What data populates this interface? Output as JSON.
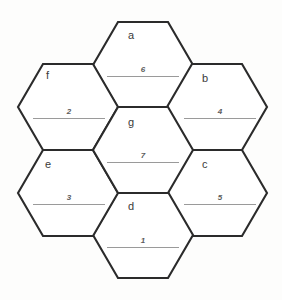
{
  "figure": {
    "type": "hexagon-puzzle-grid",
    "canvas": {
      "width": 282,
      "height": 300
    },
    "colors": {
      "background": "#fdfdfc",
      "hex_fill": "#ffffff",
      "hex_stroke": "#2b2b2b",
      "letter_text": "#3a3a3a",
      "number_text": "#5d5d5d",
      "rule_line": "#9a9a9a"
    },
    "geometry": {
      "hex_half_width": 50,
      "hex_half_height": 43,
      "hex_corner_inset": 25
    }
  },
  "cells": [
    {
      "id": "a",
      "letter": "a",
      "number": "6",
      "cx": 143,
      "cy": 65,
      "letter_x": 128,
      "letter_y": 30,
      "number_x": 143,
      "number_y": 66,
      "rule_x": 107,
      "rule_y": 76,
      "rule_w": 72
    },
    {
      "id": "b",
      "letter": "b",
      "number": "4",
      "cx": 217,
      "cy": 107,
      "letter_x": 202,
      "letter_y": 73,
      "number_x": 220,
      "number_y": 108,
      "rule_x": 184,
      "rule_y": 118,
      "rule_w": 72
    },
    {
      "id": "c",
      "letter": "c",
      "number": "5",
      "cx": 217,
      "cy": 193,
      "letter_x": 202,
      "letter_y": 159,
      "number_x": 220,
      "number_y": 194,
      "rule_x": 184,
      "rule_y": 204,
      "rule_w": 72
    },
    {
      "id": "d",
      "letter": "d",
      "number": "1",
      "cx": 143,
      "cy": 235,
      "letter_x": 128,
      "letter_y": 201,
      "number_x": 143,
      "number_y": 237,
      "rule_x": 107,
      "rule_y": 247,
      "rule_w": 72
    },
    {
      "id": "e",
      "letter": "e",
      "number": "3",
      "cx": 68,
      "cy": 193,
      "letter_x": 45,
      "letter_y": 159,
      "number_x": 69,
      "number_y": 194,
      "rule_x": 33,
      "rule_y": 204,
      "rule_w": 72
    },
    {
      "id": "f",
      "letter": "f",
      "number": "2",
      "cx": 68,
      "cy": 107,
      "letter_x": 46,
      "letter_y": 70,
      "number_x": 69,
      "number_y": 108,
      "rule_x": 33,
      "rule_y": 118,
      "rule_w": 72
    },
    {
      "id": "g",
      "letter": "g",
      "number": "7",
      "cx": 143,
      "cy": 150,
      "letter_x": 128,
      "letter_y": 117,
      "number_x": 143,
      "number_y": 152,
      "rule_x": 107,
      "rule_y": 162,
      "rule_w": 72
    }
  ]
}
